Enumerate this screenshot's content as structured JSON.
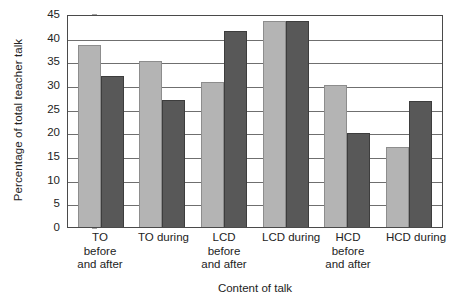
{
  "chart_data": {
    "type": "bar",
    "title": "",
    "subtitle": "",
    "xlabel": "Content of talk",
    "ylabel": "Percentage of total teacher talk",
    "categories": [
      "TO\nbefore\nand after",
      "TO during",
      "LCD\nbefore\nand after",
      "LCD during",
      "HCD\nbefore\nand after",
      "HCD during"
    ],
    "category_lines": [
      [
        "TO",
        "before",
        "and after"
      ],
      [
        "TO during"
      ],
      [
        "LCD",
        "before",
        "and after"
      ],
      [
        "LCD during"
      ],
      [
        "HCD",
        "before",
        "and after"
      ],
      [
        "HCD during"
      ]
    ],
    "series": [
      {
        "name": "series-light",
        "color": "#b4b4b4",
        "values": [
          38.5,
          35.0,
          30.7,
          43.5,
          30.0,
          17.0
        ]
      },
      {
        "name": "series-dark",
        "color": "#585858",
        "values": [
          31.8,
          26.8,
          41.5,
          43.5,
          19.8,
          26.7
        ]
      }
    ],
    "ylim": [
      0,
      45
    ],
    "ytick_values": [
      0,
      5,
      10,
      15,
      20,
      25,
      30,
      35,
      40,
      45
    ],
    "ytick_labels": [
      "0",
      "5",
      "10",
      "15",
      "20",
      "25",
      "30",
      "35",
      "40",
      "45"
    ],
    "grid": "horizontal",
    "legend": "none",
    "legend_position": "none",
    "annotations": []
  }
}
